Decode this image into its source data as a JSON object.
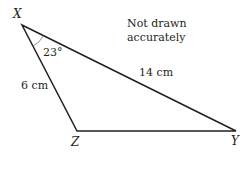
{
  "diagram": {
    "type": "triangle",
    "vertices": {
      "X": {
        "label": "X"
      },
      "Y": {
        "label": "Y"
      },
      "Z": {
        "label": "Z"
      }
    },
    "sides": {
      "XZ": {
        "label": "6 cm"
      },
      "XY": {
        "label": "14 cm"
      }
    },
    "angle": {
      "vertex": "X",
      "label": "23°"
    },
    "note": {
      "line1": "Not drawn",
      "line2": "accurately"
    },
    "colors": {
      "line": "#231f20",
      "arc": "#777777",
      "text": "#231f20"
    }
  }
}
